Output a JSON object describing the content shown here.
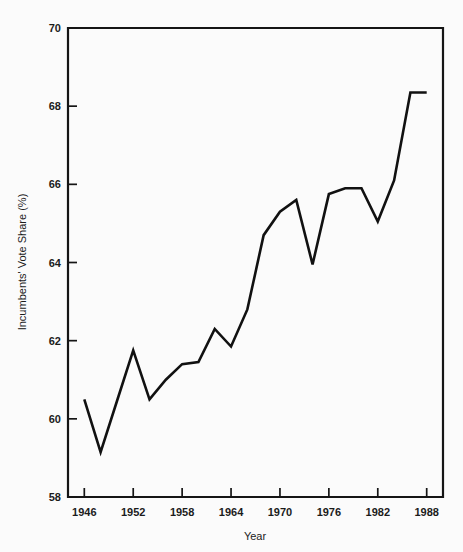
{
  "chart_data": {
    "type": "line",
    "title": "",
    "xlabel": "Year",
    "ylabel": "Incumbents' Vote Share (%)",
    "xlim": [
      1944,
      1990
    ],
    "ylim": [
      58,
      70
    ],
    "grid": false,
    "legend": "none",
    "line_color": "#111111",
    "xticks": [
      1946,
      1952,
      1958,
      1964,
      1970,
      1976,
      1982,
      1988
    ],
    "yticks": [
      58,
      60,
      62,
      64,
      66,
      68,
      70
    ],
    "x": [
      1946,
      1948,
      1950,
      1952,
      1954,
      1956,
      1958,
      1960,
      1962,
      1964,
      1966,
      1968,
      1970,
      1972,
      1974,
      1976,
      1978,
      1980,
      1982,
      1984,
      1986,
      1988
    ],
    "values": [
      60.5,
      59.15,
      60.45,
      61.75,
      60.5,
      61.0,
      61.4,
      61.45,
      62.3,
      61.85,
      62.8,
      64.7,
      65.3,
      65.6,
      63.95,
      65.75,
      65.9,
      65.9,
      65.05,
      66.1,
      68.35,
      68.35
    ],
    "series": [
      {
        "name": "Incumbents' Vote Share (%)",
        "values": [
          60.5,
          59.15,
          60.45,
          61.75,
          60.5,
          61.0,
          61.4,
          61.45,
          62.3,
          61.85,
          62.8,
          64.7,
          65.3,
          65.6,
          63.95,
          65.75,
          65.9,
          65.9,
          65.05,
          66.1,
          68.35,
          68.35
        ]
      }
    ]
  },
  "axes": {
    "x_title": "Year",
    "y_title": "Incumbents' Vote Share (%)",
    "x_tick_labels": [
      "1946",
      "1952",
      "1958",
      "1964",
      "1970",
      "1976",
      "1982",
      "1988"
    ],
    "y_tick_labels": [
      "58",
      "60",
      "62",
      "64",
      "66",
      "68",
      "70"
    ]
  },
  "caption": {
    "text": ""
  }
}
